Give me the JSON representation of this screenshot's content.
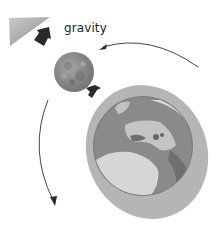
{
  "diagram": {
    "labels": {
      "gravity": "gravity"
    },
    "elements": {
      "earth_surface_wedge": "top-left gray surface wedge",
      "moon": "moon",
      "earth": "earth with ocean/atmosphere halo",
      "gravity_arrow_large": "black arrow pointing away from moon toward wedge",
      "gravity_arrow_small": "black arrow from earth toward moon",
      "orbit_arc_upper": "curved arrow from right toward moon",
      "orbit_arc_lower": "curved arrow from moon downward"
    },
    "colors": {
      "wedge": "#a9a9a9",
      "moon": "#8e8e8e",
      "halo": "#b5b5b5",
      "globe": "#8a8a8a",
      "land": "#d6d6d6",
      "arrow": "#2a2a2a",
      "line": "#444444"
    }
  }
}
